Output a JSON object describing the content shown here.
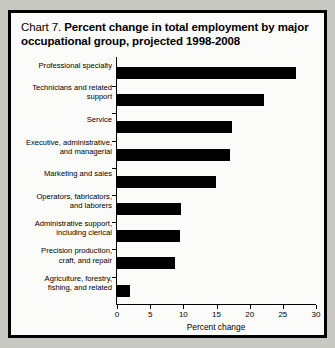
{
  "chart_title": {
    "prefix": "Chart 7.",
    "bold_text": "Percent change in total employment by major occupational group, projected 1998-2008",
    "full": "Chart 7.  Percent change in total employment by major occupational group, projected 1998-2008"
  },
  "chart_data": {
    "type": "bar",
    "orientation": "horizontal",
    "title": "Chart 7. Percent change in total employment by major occupational group, projected 1998-2008",
    "xlabel": "Percent change",
    "ylabel": "",
    "xlim": [
      0,
      30
    ],
    "xticks": [
      0,
      5,
      10,
      15,
      20,
      25,
      30
    ],
    "xtick_labels": [
      "0",
      "5",
      "10",
      "15",
      "20",
      "25",
      "30"
    ],
    "grid": false,
    "legend": false,
    "bar_color": "#000000",
    "categories": [
      "Professional specialty",
      "Technicians and related support",
      "Service",
      "Executive, administrative, and managerial",
      "Marketing and sales",
      "Operators, fabricators, and laborers",
      "Administrative support, including clerical",
      "Precision production, craft, and repair",
      "Agriculture, forestry, fishing, and related"
    ],
    "category_lines": [
      [
        "Professional specialty"
      ],
      [
        "Technicians and related",
        "support"
      ],
      [
        "Service"
      ],
      [
        "Executive, administrative,",
        "and managerial"
      ],
      [
        "Marketing and sales"
      ],
      [
        "Operators, fabricators,",
        "and laborers"
      ],
      [
        "Administrative support,",
        "including clerical"
      ],
      [
        "Precision production,",
        "craft, and repair"
      ],
      [
        "Agriculture, forestry,",
        "fishing, and related"
      ]
    ],
    "values": [
      27.0,
      22.2,
      17.3,
      17.0,
      14.9,
      9.6,
      9.5,
      8.8,
      2.0
    ]
  }
}
